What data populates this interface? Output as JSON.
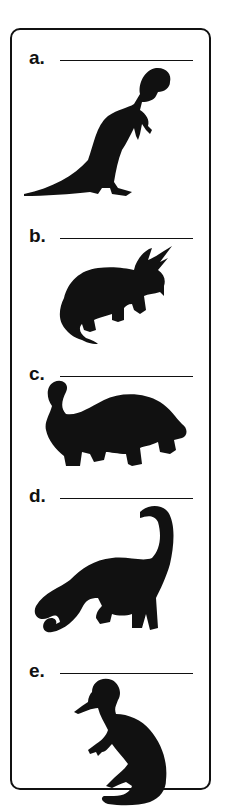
{
  "worksheet": {
    "items": [
      {
        "label": "a.",
        "answer": "",
        "icon": "tyrannosaurus-silhouette"
      },
      {
        "label": "b.",
        "answer": "",
        "icon": "triceratops-silhouette"
      },
      {
        "label": "c.",
        "answer": "",
        "icon": "ankylosaurus-silhouette"
      },
      {
        "label": "d.",
        "answer": "",
        "icon": "brontosaurus-silhouette"
      },
      {
        "label": "e.",
        "answer": "",
        "icon": "corythosaurus-silhouette"
      }
    ],
    "colors": {
      "ink": "#111111",
      "paper": "#ffffff"
    }
  }
}
